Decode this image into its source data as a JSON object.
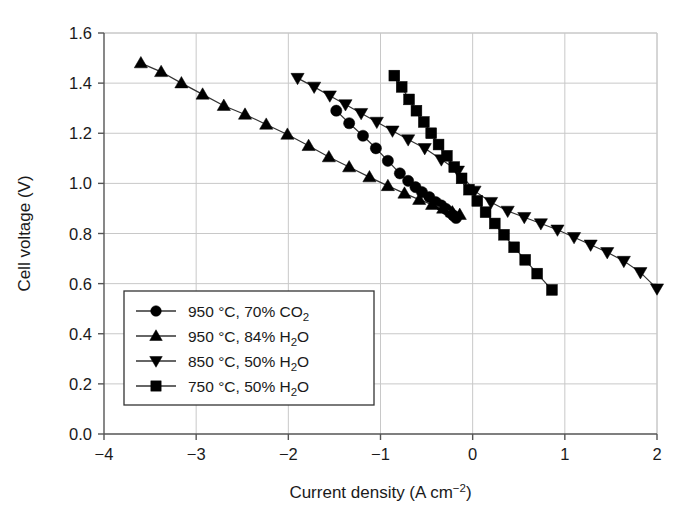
{
  "chart_data": {
    "type": "line",
    "title": "",
    "xlabel": "Current density (A cm",
    "xlabel_sup": "−2",
    "xlabel_end": ")",
    "ylabel": "Cell voltage (V)",
    "xlim": [
      -4,
      2
    ],
    "ylim": [
      0.0,
      1.6
    ],
    "xticks": [
      "−4",
      "−3",
      "−2",
      "−1",
      "0",
      "1",
      "2"
    ],
    "xtick_values": [
      -4,
      -3,
      -2,
      -1,
      0,
      1,
      2
    ],
    "yticks": [
      "0.0",
      "0.2",
      "0.4",
      "0.6",
      "0.8",
      "1.0",
      "1.2",
      "1.4",
      "1.6"
    ],
    "ytick_values": [
      0.0,
      0.2,
      0.4,
      0.6,
      0.8,
      1.0,
      1.2,
      1.4,
      1.6
    ],
    "grid": true,
    "legend_position": "lower-left",
    "marker_color": "#000000",
    "line_color": "#333333",
    "grid_color": "#c8c8c8",
    "axis_color": "#555555",
    "series": [
      {
        "name": "950 °C, 70% CO2",
        "label_main": "950 °C, 70% CO",
        "label_sub": "2",
        "marker": "circle",
        "x": [
          -1.48,
          -1.34,
          -1.19,
          -1.05,
          -0.92,
          -0.79,
          -0.7,
          -0.62,
          -0.55,
          -0.47,
          -0.4,
          -0.34,
          -0.29,
          -0.25,
          -0.21,
          -0.18
        ],
        "y": [
          1.29,
          1.24,
          1.19,
          1.14,
          1.09,
          1.04,
          1.01,
          0.985,
          0.965,
          0.945,
          0.925,
          0.912,
          0.898,
          0.885,
          0.872,
          0.862
        ]
      },
      {
        "name": "950 °C, 84% H2O",
        "label_main": "950 °C, 84% H",
        "label_sub": "2",
        "label_end": "O",
        "marker": "triangle-up",
        "x": [
          -3.6,
          -3.38,
          -3.16,
          -2.93,
          -2.7,
          -2.47,
          -2.24,
          -2.01,
          -1.78,
          -1.56,
          -1.34,
          -1.12,
          -0.92,
          -0.74,
          -0.58,
          -0.44,
          -0.32,
          -0.22,
          -0.14
        ],
        "y": [
          1.48,
          1.445,
          1.4,
          1.355,
          1.31,
          1.275,
          1.235,
          1.195,
          1.15,
          1.105,
          1.065,
          1.025,
          0.99,
          0.96,
          0.935,
          0.915,
          0.9,
          0.885,
          0.875
        ]
      },
      {
        "name": "850 °C, 50% H2O",
        "label_main": "850 °C, 50% H",
        "label_sub": "2",
        "label_end": "O",
        "marker": "triangle-down",
        "x": [
          -1.9,
          -1.72,
          -1.55,
          -1.38,
          -1.21,
          -1.04,
          -0.87,
          -0.7,
          -0.52,
          -0.34,
          -0.16,
          0.02,
          0.2,
          0.38,
          0.56,
          0.74,
          0.92,
          1.1,
          1.28,
          1.46,
          1.64,
          1.82,
          2.0
        ],
        "y": [
          1.42,
          1.385,
          1.35,
          1.315,
          1.28,
          1.245,
          1.21,
          1.175,
          1.14,
          1.095,
          1.05,
          0.97,
          0.925,
          0.89,
          0.865,
          0.84,
          0.815,
          0.785,
          0.755,
          0.725,
          0.69,
          0.645,
          0.58
        ]
      },
      {
        "name": "750 °C, 50% H2O",
        "label_main": "750 °C, 50% H",
        "label_sub": "2",
        "label_end": "O",
        "marker": "square",
        "x": [
          -0.85,
          -0.77,
          -0.69,
          -0.61,
          -0.53,
          -0.45,
          -0.37,
          -0.28,
          -0.2,
          -0.12,
          -0.04,
          0.05,
          0.14,
          0.24,
          0.34,
          0.45,
          0.57,
          0.7,
          0.86
        ],
        "y": [
          1.43,
          1.385,
          1.335,
          1.29,
          1.245,
          1.2,
          1.155,
          1.11,
          1.065,
          1.02,
          0.975,
          0.93,
          0.885,
          0.84,
          0.795,
          0.745,
          0.695,
          0.64,
          0.575
        ]
      }
    ]
  }
}
